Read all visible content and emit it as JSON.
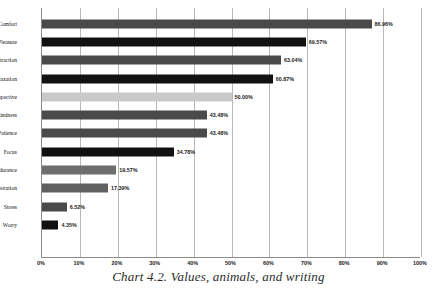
{
  "chart_data": {
    "type": "bar",
    "orientation": "horizontal",
    "title": "",
    "caption": "Chart 4.2. Values, animals, and writing",
    "xlabel": "",
    "ylabel": "",
    "xlim": [
      0,
      100
    ],
    "grid": true,
    "legend": "none",
    "xticks": [
      "0%",
      "10%",
      "20%",
      "30%",
      "40%",
      "50%",
      "60%",
      "70%",
      "80%",
      "90%",
      "100%"
    ],
    "xtick_values": [
      0,
      10,
      20,
      30,
      40,
      50,
      60,
      70,
      80,
      90,
      100
    ],
    "categories": [
      "Comfort",
      "Pleasure",
      "Distraction",
      "Relaxation",
      "Perspective",
      "Kindness",
      "Patience",
      "Focus",
      "Endurance",
      "Frustration",
      "Stress",
      "Worry"
    ],
    "values": [
      86.96,
      69.57,
      63.04,
      60.87,
      50.0,
      43.48,
      43.48,
      34.78,
      19.57,
      17.39,
      6.52,
      4.35
    ],
    "value_labels": [
      "86.96%",
      "69.57%",
      "63.04%",
      "60.87%",
      "50.00%",
      "43.48%",
      "43.48%",
      "34.78%",
      "19.57%",
      "17.39%",
      "6.52%",
      "4.35%"
    ],
    "bar_colors": [
      "#4a4a4a",
      "#111111",
      "#4a4a4a",
      "#111111",
      "#c9c9c9",
      "#4a4a4a",
      "#4a4a4a",
      "#111111",
      "#6e6e6e",
      "#606060",
      "#4a4a4a",
      "#111111"
    ],
    "axis_color": "#8a8a8a",
    "grid_color": "#b8b8b8",
    "background": "#ffffff"
  }
}
